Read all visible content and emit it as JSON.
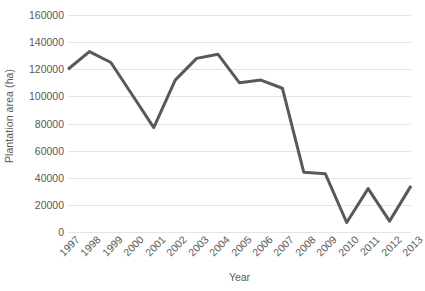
{
  "chart_data": {
    "type": "line",
    "title": "",
    "xlabel": "Year",
    "ylabel": "Plantation area (ha)",
    "categories": [
      "1997",
      "1998",
      "1999",
      "2000",
      "2001",
      "2002",
      "2003",
      "2004",
      "2005",
      "2006",
      "2007",
      "2008",
      "2009",
      "2010",
      "2011",
      "2012",
      "2013"
    ],
    "values": [
      120000,
      133000,
      125000,
      101000,
      77000,
      112000,
      128000,
      131000,
      110000,
      112000,
      106000,
      44000,
      43000,
      7000,
      32000,
      8000,
      34000
    ],
    "series": [
      {
        "name": "Plantation area",
        "color": "#595959",
        "values": [
          120000,
          133000,
          125000,
          101000,
          77000,
          112000,
          128000,
          131000,
          110000,
          112000,
          106000,
          44000,
          43000,
          7000,
          32000,
          8000,
          34000
        ]
      }
    ],
    "ylim": [
      0,
      160000
    ],
    "ytick_values": [
      0,
      20000,
      40000,
      60000,
      80000,
      100000,
      120000,
      140000,
      160000
    ],
    "ytick_labels": [
      "0",
      "20000",
      "40000",
      "60000",
      "80000",
      "100000",
      "120000",
      "140000",
      "160000"
    ],
    "grid": true,
    "grid_color": "#e4e4e4",
    "legend": false,
    "legend_position": "none",
    "line_width": 3,
    "markers": false,
    "background_color": "#ffffff",
    "text_color": "#595959",
    "xtick_rotation": -45
  }
}
